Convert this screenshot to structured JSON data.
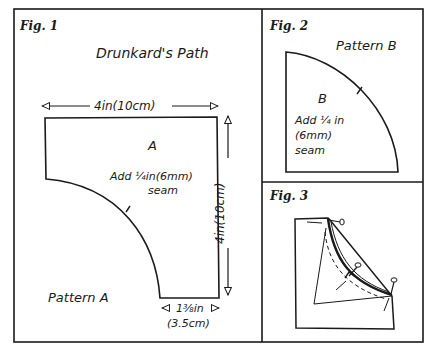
{
  "colors": {
    "ink": "#1a1a1a",
    "paper": "#ffffff"
  },
  "fig1": {
    "label": "Fig. 1",
    "title": "Drunkard's Path",
    "piece_letter": "A",
    "seam_line1": "Add ¼in(6mm)",
    "seam_line2": "seam",
    "dim_top": "4in(10cm)",
    "dim_right": "4in(10cm)",
    "dim_bottom_line1": "1⅜in",
    "dim_bottom_line2": "(3.5cm)",
    "pattern_name": "Pattern A"
  },
  "fig2": {
    "label": "Fig. 2",
    "pattern_name": "Pattern B",
    "piece_letter": "B",
    "seam_line1": "Add ¼ in",
    "seam_line2": "(6mm)",
    "seam_line3": "seam"
  },
  "fig3": {
    "label": "Fig. 3"
  }
}
